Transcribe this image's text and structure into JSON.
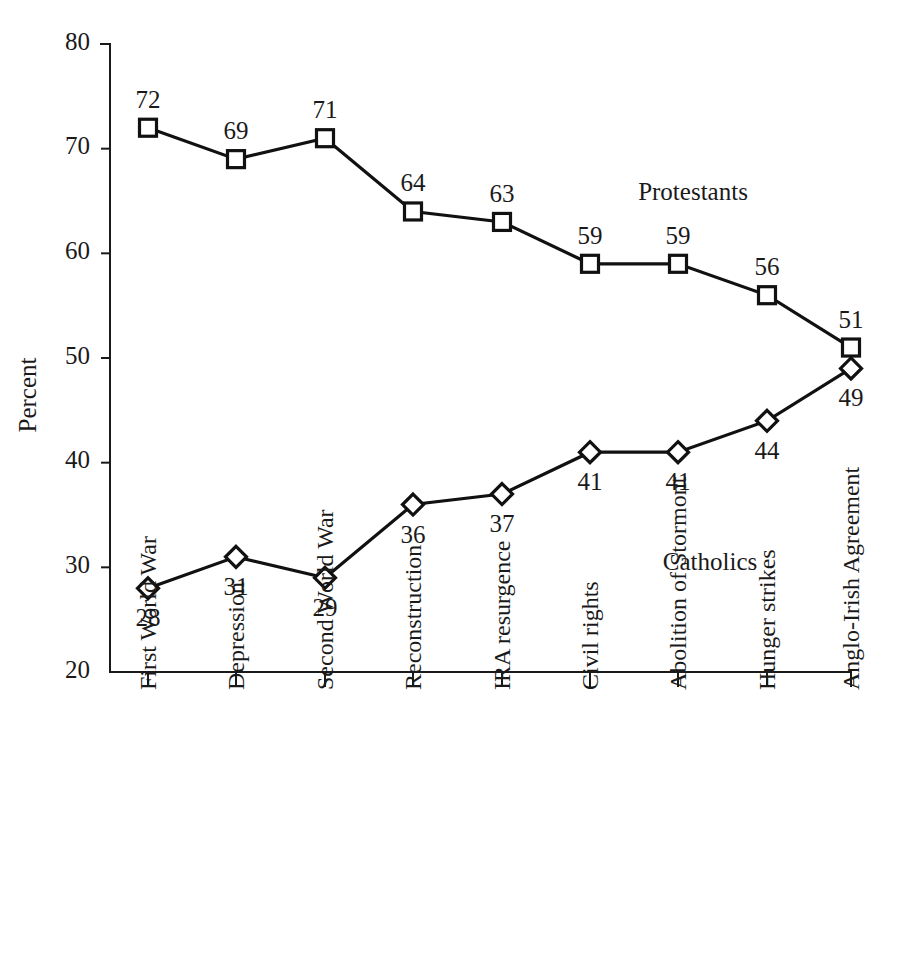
{
  "chart_data": {
    "type": "line",
    "title": "",
    "subtitle": "",
    "xlabel": "",
    "ylabel": "Percent",
    "ylim": [
      20,
      80
    ],
    "ytick_values": [
      20,
      30,
      40,
      50,
      60,
      70,
      80
    ],
    "ytick_labels": [
      "20",
      "30",
      "40",
      "50",
      "60",
      "70",
      "80"
    ],
    "grid": false,
    "legend_position": "inline-annotation",
    "categories": [
      "First World War",
      "Depression",
      "Second World War",
      "Reconstruction",
      "IRA resurgence",
      "Civil rights",
      "Abolition of Stormont",
      "Hunger strikes",
      "Anglo-Irish Agreement"
    ],
    "series": [
      {
        "name": "Protestants",
        "marker": "square",
        "values": [
          72,
          69,
          71,
          64,
          63,
          59,
          59,
          56,
          51
        ],
        "labels": [
          "72",
          "69",
          "71",
          "64",
          "63",
          "59",
          "59",
          "56",
          "51"
        ],
        "label_positions": [
          "above",
          "above",
          "above",
          "above",
          "above",
          "above",
          "above",
          "above",
          "above"
        ]
      },
      {
        "name": "Catholics",
        "marker": "diamond",
        "values": [
          28,
          31,
          29,
          36,
          37,
          41,
          41,
          44,
          49
        ],
        "labels": [
          "28",
          "31",
          "29",
          "36",
          "37",
          "41",
          "41",
          "44",
          "49"
        ],
        "label_positions": [
          "below",
          "below",
          "below",
          "below",
          "below",
          "below",
          "below",
          "below",
          "below"
        ]
      }
    ],
    "annotations": [
      {
        "text": "Protestants",
        "series": "Protestants"
      },
      {
        "text": "Catholics",
        "series": "Catholics"
      }
    ],
    "colors": {
      "line": "#111111",
      "marker_fill": "#ffffff",
      "axis": "#1a1a1a",
      "text": "#1a1a1a",
      "background": "#ffffff"
    }
  },
  "layout": {
    "plot_left": 110,
    "plot_right": 851,
    "plot_top": 44,
    "plot_bottom": 672,
    "x_positions": [
      148,
      236,
      325,
      413,
      502,
      590,
      678,
      767,
      851
    ],
    "ylabel_x": 36,
    "ylabel_y": 395,
    "annotation_protestants": {
      "x": 693,
      "y": 200
    },
    "annotation_catholics": {
      "x": 710,
      "y": 570
    },
    "xcat_label_top": 690
  }
}
